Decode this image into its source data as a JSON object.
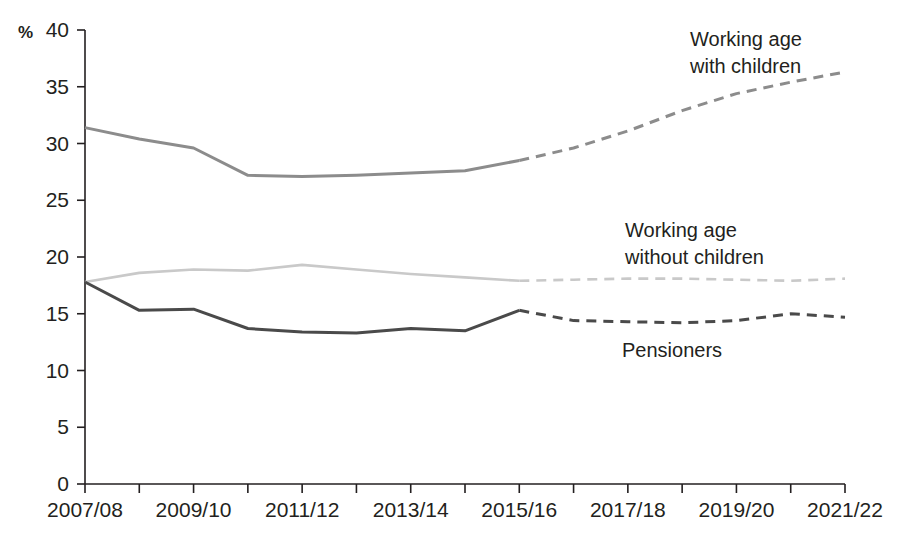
{
  "chart_data": {
    "type": "line",
    "title": "",
    "subtitle": "",
    "xlabel": "",
    "ylabel": "%",
    "unit_symbol": "%",
    "ylim": [
      0,
      40
    ],
    "ytick_values": [
      0,
      5,
      10,
      15,
      20,
      25,
      30,
      35,
      40
    ],
    "ytick_labels": [
      "0",
      "5",
      "10",
      "15",
      "20",
      "25",
      "30",
      "35",
      "40"
    ],
    "grid": false,
    "legend_position": "inline-annotations",
    "x": [
      "2007/08",
      "2008/09",
      "2009/10",
      "2010/11",
      "2011/12",
      "2012/13",
      "2013/14",
      "2014/15",
      "2015/16",
      "2016/17",
      "2017/18",
      "2018/19",
      "2019/20",
      "2020/21",
      "2021/22"
    ],
    "xtick_labels_shown": [
      "2007/08",
      "2009/10",
      "2011/12",
      "2013/14",
      "2015/16",
      "2017/18",
      "2019/20",
      "2021/22"
    ],
    "xtick_label_indices": [
      0,
      2,
      4,
      6,
      8,
      10,
      12,
      14
    ],
    "forecast_start_index": 8,
    "forecast_note": "Values from 2015/16 onward are shown with dashed lines (projected)",
    "series": [
      {
        "name": "Working age with children",
        "color": "#8c8c8c",
        "values": [
          31.4,
          30.4,
          29.6,
          27.2,
          27.1,
          27.2,
          27.4,
          27.6,
          28.5,
          29.6,
          31.1,
          32.9,
          34.4,
          35.4,
          36.3
        ],
        "annotation": "Working age\nwith children",
        "annotation_lines": [
          "Working age",
          "with children"
        ]
      },
      {
        "name": "Working age without children",
        "color": "#c9c9c9",
        "values": [
          17.8,
          18.6,
          18.9,
          18.8,
          19.3,
          18.9,
          18.5,
          18.2,
          17.9,
          18.0,
          18.1,
          18.1,
          18.0,
          17.9,
          18.1
        ],
        "annotation": "Working age\nwithout children",
        "annotation_lines": [
          "Working age",
          "without children"
        ]
      },
      {
        "name": "Pensioners",
        "color": "#4a4a4a",
        "values": [
          17.8,
          15.3,
          15.4,
          13.7,
          13.4,
          13.3,
          13.7,
          13.5,
          15.3,
          14.4,
          14.3,
          14.2,
          14.4,
          15.0,
          14.7
        ],
        "annotation": "Pensioners",
        "annotation_lines": [
          "Pensioners"
        ]
      }
    ]
  },
  "annotations": {
    "working_age_with_children": {
      "line1": "Working age",
      "line2": "with children"
    },
    "working_age_without_children": {
      "line1": "Working age",
      "line2": "without children"
    },
    "pensioners": {
      "line1": "Pensioners"
    }
  }
}
